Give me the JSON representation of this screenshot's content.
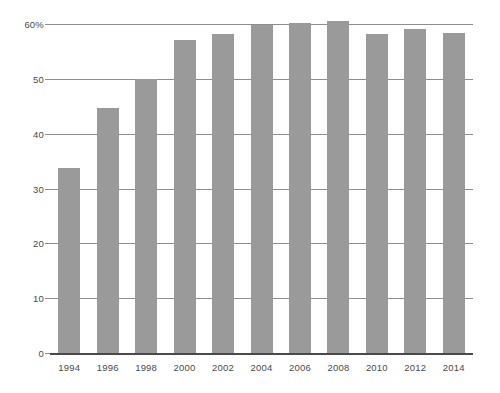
{
  "chart_data": {
    "type": "bar",
    "title": "",
    "subtitle": "",
    "xlabel": "",
    "ylabel": "",
    "categories": [
      "1994",
      "1996",
      "1998",
      "2000",
      "2002",
      "2004",
      "2006",
      "2008",
      "2010",
      "2012",
      "2014"
    ],
    "values": [
      33.7,
      44.7,
      50.0,
      57.0,
      58.2,
      59.8,
      60.2,
      60.6,
      58.1,
      59.0,
      58.3
    ],
    "series": [
      {
        "name": "",
        "values": [
          33.7,
          44.7,
          50.0,
          57.0,
          58.2,
          59.8,
          60.2,
          60.6,
          58.1,
          59.0,
          58.3
        ]
      }
    ],
    "ylim": [
      0,
      60
    ],
    "xlim": [
      "1994",
      "2014"
    ],
    "y_ticks": [
      0,
      10,
      20,
      30,
      40,
      50,
      60
    ],
    "y_tick_labels": [
      "0",
      "10",
      "20",
      "30",
      "40",
      "50",
      "60%"
    ],
    "grid": true,
    "grid_axis": "y",
    "legend": false,
    "legend_position": "none",
    "bar_color": "#9a9a9a",
    "grid_color": "#8e8e8e",
    "axis_color": "#4a4a4a",
    "background": "#ffffff",
    "annotations": []
  }
}
